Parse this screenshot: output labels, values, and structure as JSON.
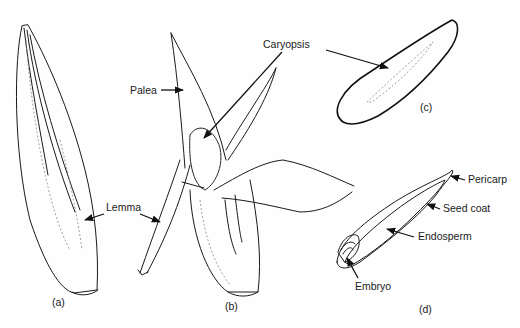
{
  "figure": {
    "panels": [
      {
        "id": "a",
        "caption": "(a)"
      },
      {
        "id": "b",
        "caption": "(b)"
      },
      {
        "id": "c",
        "caption": "(c)"
      },
      {
        "id": "d",
        "caption": "(d)"
      }
    ],
    "labels": {
      "palea": "Palea",
      "lemma": "Lemma",
      "caryopsis": "Caryopsis",
      "pericarp": "Pericarp",
      "seed_coat": "Seed coat",
      "endosperm": "Endosperm",
      "embryo": "Embryo"
    }
  }
}
